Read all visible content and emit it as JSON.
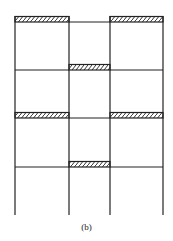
{
  "figure": {
    "caption": "(b)",
    "colors": {
      "line": "#222222",
      "hatch": "#333333",
      "background": "#ffffff"
    },
    "bays": 3,
    "stories": 4,
    "hatched_beams": [
      {
        "level": 1,
        "bays": [
          1,
          3
        ]
      },
      {
        "level": 2,
        "bays": [
          2
        ]
      },
      {
        "level": 3,
        "bays": [
          1,
          3
        ]
      },
      {
        "level": 4,
        "bays": [
          2
        ]
      }
    ]
  }
}
